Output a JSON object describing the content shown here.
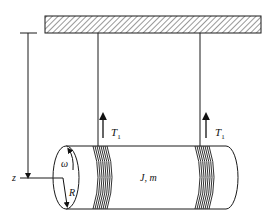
{
  "diagram": {
    "labels": {
      "tension_left": "T",
      "tension_left_sub": "1",
      "tension_right": "T",
      "tension_right_sub": "1",
      "axis": "z",
      "omega": "ω",
      "radius": "R",
      "body": "J, m"
    },
    "colors": {
      "stroke": "#1a1a1a",
      "background": "#ffffff"
    }
  }
}
